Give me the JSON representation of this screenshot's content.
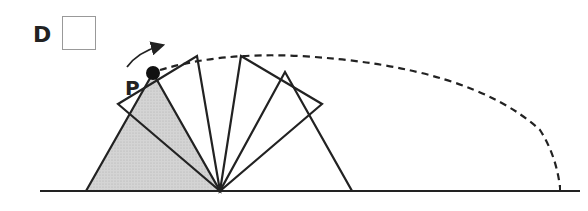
{
  "option_label": "D",
  "point_label": "P",
  "answer_box": {
    "checked": false
  },
  "colors": {
    "stroke": "#222222",
    "shade": "#cfcfcf",
    "box_border": "#999999"
  },
  "figure": {
    "ground": {
      "x1": 40,
      "x2": 580,
      "y": 191
    },
    "pivot": {
      "x": 220,
      "y": 191
    },
    "triangles": [
      {
        "points": [
          [
            86,
            191
          ],
          [
            153,
            73
          ],
          [
            220,
            191
          ]
        ],
        "shaded": true
      },
      {
        "points": [
          [
            118,
            104
          ],
          [
            197,
            56
          ],
          [
            220,
            191
          ]
        ],
        "shaded": false
      },
      {
        "points": [
          [
            241,
            56
          ],
          [
            322,
            104
          ],
          [
            220,
            191
          ]
        ],
        "shaded": false
      },
      {
        "points": [
          [
            285,
            72
          ],
          [
            352,
            191
          ],
          [
            220,
            191
          ]
        ],
        "shaded": false
      }
    ],
    "point_p": {
      "x": 153,
      "y": 73
    },
    "path": {
      "style": "dashed",
      "end_x": 560
    },
    "rotation_arrow": "clockwise"
  }
}
